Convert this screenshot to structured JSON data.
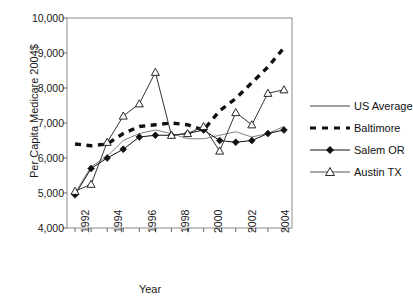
{
  "chart_data": {
    "type": "line",
    "title": "",
    "xlabel": "Year",
    "ylabel": "Per Capita Medicare 2004$",
    "x": [
      1992,
      1993,
      1994,
      1995,
      1996,
      1997,
      1998,
      1999,
      2000,
      2001,
      2002,
      2003,
      2004,
      2005
    ],
    "xlim": [
      1991.5,
      2005.5
    ],
    "ylim": [
      4000,
      10000
    ],
    "yticks": [
      4000,
      5000,
      6000,
      7000,
      8000,
      9000,
      10000
    ],
    "ytick_labels": [
      "4,000",
      "5,000",
      "6,000",
      "7,000",
      "8,000",
      "9,000",
      "10,000"
    ],
    "xticks": [
      1992,
      1993,
      1994,
      1995,
      1996,
      1997,
      1998,
      1999,
      2000,
      2001,
      2002,
      2003,
      2004,
      2005
    ],
    "xtick_labels": [
      "1992",
      "",
      "1994",
      "",
      "1996",
      "",
      "1998",
      "",
      "2000",
      "",
      "2002",
      "",
      "2004",
      ""
    ],
    "grid": false,
    "legend_position": "right",
    "series": [
      {
        "name": "US Average",
        "style": "solid-line",
        "marker": "none",
        "color": "#808080",
        "values": [
          5000,
          5750,
          6050,
          6500,
          6700,
          6800,
          6700,
          6550,
          6550,
          6650,
          6750,
          6600,
          6700,
          6900
        ]
      },
      {
        "name": "Baltimore",
        "style": "dashed-thick",
        "marker": "none",
        "color": "#111111",
        "values": [
          6400,
          6350,
          6400,
          6700,
          6900,
          6950,
          7000,
          6950,
          6800,
          7350,
          7700,
          8150,
          8600,
          9150
        ]
      },
      {
        "name": "Salem OR",
        "style": "solid-line",
        "marker": "filled-diamond",
        "color": "#111111",
        "values": [
          4950,
          5700,
          6000,
          6250,
          6600,
          6650,
          6650,
          6700,
          6800,
          6500,
          6450,
          6500,
          6700,
          6800
        ]
      },
      {
        "name": "Austin TX",
        "style": "solid-line",
        "marker": "open-triangle",
        "color": "#333333",
        "values": [
          5050,
          5250,
          6450,
          7200,
          7550,
          8450,
          6650,
          6700,
          6900,
          6200,
          7300,
          6950,
          7850,
          7950
        ]
      }
    ]
  },
  "legend": {
    "items": [
      {
        "label": "US Average"
      },
      {
        "label": "Baltimore"
      },
      {
        "label": "Salem OR"
      },
      {
        "label": "Austin TX"
      }
    ]
  },
  "axes": {
    "x_title": "Year",
    "y_title": "Per Capita Medicare 2004$"
  }
}
